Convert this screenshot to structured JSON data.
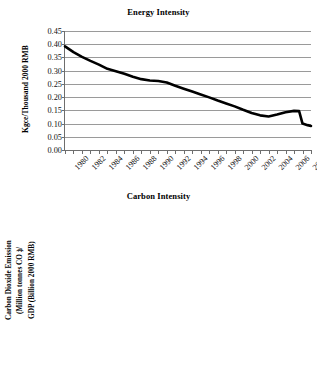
{
  "figure": {
    "background": "#ffffff",
    "line_color": "#000000",
    "grid_color": "#9a9a9a"
  },
  "chart_data": [
    {
      "type": "line",
      "title": "Energy Intensity",
      "xlabel": "",
      "ylabel": "Kgce/Thousand 2000 RMB",
      "ylim": [
        0.0,
        0.45
      ],
      "yticks": [
        "0.00",
        "0.05",
        "0.10",
        "0.15",
        "0.20",
        "0.25",
        "0.30",
        "0.35",
        "0.40",
        "0.45"
      ],
      "ytick_values": [
        0.0,
        0.05,
        0.1,
        0.15,
        0.2,
        0.25,
        0.3,
        0.35,
        0.4,
        0.45
      ],
      "xlim": [
        1980,
        2009
      ],
      "xtick_labels": [
        "1980",
        "1982",
        "1984",
        "1986",
        "1988",
        "1990",
        "1992",
        "1994",
        "1996",
        "1998",
        "2000",
        "2002",
        "2004",
        "2006",
        "2008"
      ],
      "grid": "horizontal",
      "legend": "none",
      "x": [
        1980,
        1981,
        1982,
        1983,
        1984,
        1985,
        1986,
        1987,
        1988,
        1989,
        1990,
        1991,
        1992,
        1993,
        1994,
        1995,
        1996,
        1997,
        1998,
        1999,
        2000,
        2001,
        2002,
        2003,
        2004,
        2005,
        2006,
        2007,
        2008,
        2009
      ],
      "values": [
        0.392,
        0.37,
        0.352,
        0.337,
        0.323,
        0.307,
        0.298,
        0.288,
        0.277,
        0.268,
        0.263,
        0.261,
        0.255,
        0.243,
        0.232,
        0.221,
        0.21,
        0.199,
        0.187,
        0.176,
        0.165,
        0.152,
        0.14,
        0.131,
        0.127,
        0.134,
        0.143,
        0.148,
        0.147,
        0.108
      ]
    },
    {
      "type": "line",
      "title": "Carbon Intensity",
      "xlabel": "",
      "ylabel": "Carbon Dioxide Emission (Million tonnes CO2)/ GDP (Billion 2000 RMB)",
      "ylabel_lines": [
        "Carbon Dioxide Emission",
        "(Million tonnes CO2)/",
        "GDP (Billion 2000 RMB)"
      ],
      "ylim": [
        0,
        1.2
      ],
      "yticks": [
        "0",
        "0.2",
        "0.4",
        "0.6",
        "0.8",
        "1",
        "1.2"
      ],
      "ytick_values": [
        0,
        0.2,
        0.4,
        0.6,
        0.8,
        1,
        1.2
      ],
      "xlim": [
        1980,
        2009
      ],
      "xtick_labels": [
        "1980",
        "1982",
        "1984",
        "1986",
        "1988",
        "1990",
        "1992",
        "1994",
        "1996",
        "1998",
        "2000",
        "2002",
        "2004",
        "2006",
        "2008"
      ],
      "grid": "horizontal",
      "legend": "none",
      "x": [
        1980,
        1981,
        1982,
        1983,
        1984,
        1985,
        1986,
        1987,
        1988,
        1989,
        1990,
        1991,
        1992,
        1993,
        1994,
        1995,
        1996,
        1997,
        1998,
        1999,
        2000,
        2001,
        2002,
        2003,
        2004,
        2005,
        2006,
        2007,
        2008,
        2009
      ],
      "values": [
        1.005,
        0.955,
        0.915,
        0.88,
        0.845,
        0.8,
        0.755,
        0.725,
        0.7,
        0.665,
        0.64,
        0.61,
        0.655,
        0.62,
        0.59,
        0.56,
        0.53,
        0.505,
        0.48,
        0.455,
        0.44,
        0.42,
        0.39,
        0.36,
        0.33,
        0.305,
        0.29,
        0.285,
        0.292,
        0.312
      ]
    }
  ],
  "energy_series_override": {
    "note_points": [
      [
        1980,
        0.392
      ],
      [
        1982,
        0.352
      ],
      [
        1984,
        0.323
      ],
      [
        1986,
        0.298
      ],
      [
        1988,
        0.277
      ],
      [
        1990,
        0.263
      ],
      [
        1992,
        0.255
      ],
      [
        1994,
        0.232
      ],
      [
        1996,
        0.21
      ],
      [
        1998,
        0.187
      ],
      [
        2000,
        0.165
      ],
      [
        2002,
        0.14
      ],
      [
        2004,
        0.127
      ],
      [
        2006,
        0.147
      ],
      [
        2008,
        0.092
      ]
    ]
  }
}
